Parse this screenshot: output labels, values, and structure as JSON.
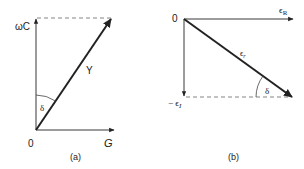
{
  "diagram_a": {
    "caption": "(a)",
    "origin_label": "0",
    "x_axis_label": "G",
    "y_axis_label": "ωC",
    "vector_label": "Y",
    "angle_label": "δ"
  },
  "diagram_b": {
    "caption": "(b)",
    "origin_label": "0",
    "x_axis_label": "ϵ",
    "x_axis_subscript": "R",
    "y_axis_label": "− ϵ",
    "y_axis_subscript": "I",
    "vector_label": "ϵ",
    "vector_subscript": "r",
    "angle_label": "δ"
  },
  "colors": {
    "line": "#222222",
    "dashed": "#777777"
  }
}
